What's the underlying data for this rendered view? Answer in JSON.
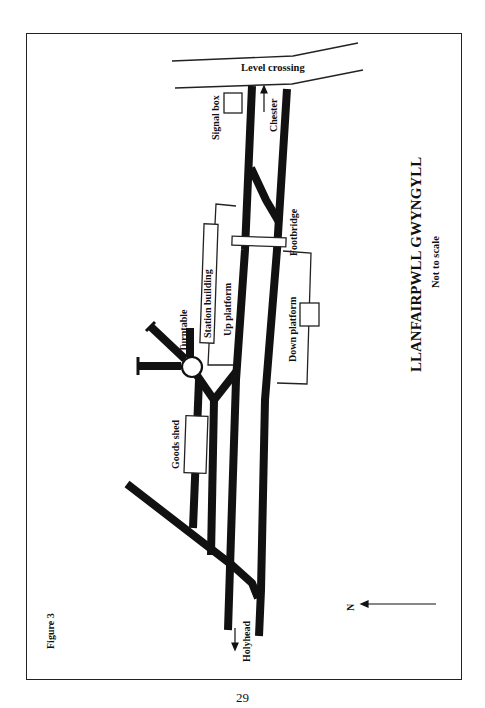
{
  "figure": {
    "label": "Figure 3",
    "title": "LLANFAIRPWLL GWYNGYLL",
    "subtitle": "Not to scale",
    "page_number": "29"
  },
  "labels": {
    "level_crossing": "Level crossing",
    "signal_box": "Signal box",
    "chester": "Chester",
    "footbridge": "Footbridge",
    "station_building": "Station building",
    "up_platform": "Up platform",
    "down_platform": "Down platform",
    "turntable": "Turntable",
    "goods_shed": "Goods shed",
    "holyhead": "Holyhead",
    "north": "N"
  },
  "colors": {
    "track": "#111111",
    "outline": "#222222",
    "background": "#ffffff"
  }
}
